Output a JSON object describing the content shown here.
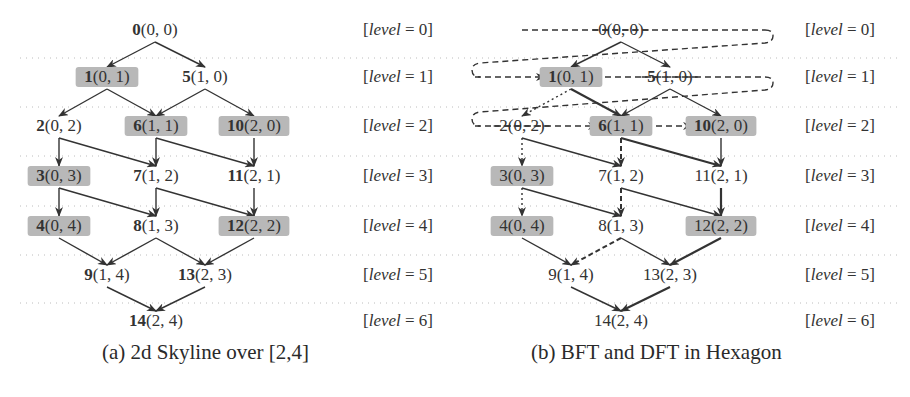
{
  "colors": {
    "ink": "#333333",
    "highlight": "#b8b8b8",
    "gridline": "#bcbcbc",
    "background": "#ffffff"
  },
  "panels": [
    {
      "id": "a",
      "caption": "(a) 2d Skyline over [2,4]",
      "bold_ids": true,
      "level_x": 363,
      "nodes": [
        {
          "id": "0",
          "coord": "(0,0)",
          "level": 0,
          "x": 155,
          "highlighted": false
        },
        {
          "id": "1",
          "coord": "(0,1)",
          "level": 1,
          "x": 107,
          "highlighted": true
        },
        {
          "id": "5",
          "coord": "(1,0)",
          "level": 1,
          "x": 205,
          "highlighted": false
        },
        {
          "id": "2",
          "coord": "(0,2)",
          "level": 2,
          "x": 59,
          "highlighted": false
        },
        {
          "id": "6",
          "coord": "(1,1)",
          "level": 2,
          "x": 156,
          "highlighted": true
        },
        {
          "id": "10",
          "coord": "(2,0)",
          "level": 2,
          "x": 254,
          "highlighted": true
        },
        {
          "id": "3",
          "coord": "(0,3)",
          "level": 3,
          "x": 59,
          "highlighted": true
        },
        {
          "id": "7",
          "coord": "(1,2)",
          "level": 3,
          "x": 156,
          "highlighted": false
        },
        {
          "id": "11",
          "coord": "(2,1)",
          "level": 3,
          "x": 254,
          "highlighted": false
        },
        {
          "id": "4",
          "coord": "(0,4)",
          "level": 4,
          "x": 59,
          "highlighted": true
        },
        {
          "id": "8",
          "coord": "(1,3)",
          "level": 4,
          "x": 156,
          "highlighted": false
        },
        {
          "id": "12",
          "coord": "(2,2)",
          "level": 4,
          "x": 254,
          "highlighted": true
        },
        {
          "id": "9",
          "coord": "(1,4)",
          "level": 5,
          "x": 107,
          "highlighted": false
        },
        {
          "id": "13",
          "coord": "(2,3)",
          "level": 5,
          "x": 205,
          "highlighted": false
        },
        {
          "id": "14",
          "coord": "(2,4)",
          "level": 6,
          "x": 156,
          "highlighted": false
        }
      ],
      "edges": [
        {
          "from": "0",
          "to": "1",
          "style": "solid"
        },
        {
          "from": "0",
          "to": "5",
          "style": "solid"
        },
        {
          "from": "1",
          "to": "2",
          "style": "solid"
        },
        {
          "from": "1",
          "to": "6",
          "style": "solid"
        },
        {
          "from": "5",
          "to": "6",
          "style": "solid"
        },
        {
          "from": "5",
          "to": "10",
          "style": "solid"
        },
        {
          "from": "2",
          "to": "3",
          "style": "solid"
        },
        {
          "from": "2",
          "to": "7",
          "style": "solid"
        },
        {
          "from": "6",
          "to": "7",
          "style": "solid"
        },
        {
          "from": "6",
          "to": "11",
          "style": "solid"
        },
        {
          "from": "10",
          "to": "11",
          "style": "solid"
        },
        {
          "from": "3",
          "to": "4",
          "style": "solid"
        },
        {
          "from": "3",
          "to": "8",
          "style": "solid"
        },
        {
          "from": "7",
          "to": "8",
          "style": "solid"
        },
        {
          "from": "7",
          "to": "12",
          "style": "solid"
        },
        {
          "from": "11",
          "to": "12",
          "style": "solid"
        },
        {
          "from": "4",
          "to": "9",
          "style": "solid"
        },
        {
          "from": "8",
          "to": "9",
          "style": "solid"
        },
        {
          "from": "8",
          "to": "13",
          "style": "solid"
        },
        {
          "from": "12",
          "to": "13",
          "style": "solid"
        },
        {
          "from": "9",
          "to": "14",
          "style": "solid"
        },
        {
          "from": "13",
          "to": "14",
          "style": "solid"
        }
      ]
    },
    {
      "id": "b",
      "caption": "(b) BFT and DFT in Hexagon",
      "bold_ids": false,
      "level_x": 805,
      "nodes": [
        {
          "id": "0",
          "coord": "(0,0)",
          "level": 0,
          "x": 621,
          "highlighted": false,
          "struck": true
        },
        {
          "id": "1",
          "coord": "(0,1)",
          "level": 1,
          "x": 571,
          "highlighted": true,
          "bold": true
        },
        {
          "id": "5",
          "coord": "(1,0)",
          "level": 1,
          "x": 670,
          "highlighted": false,
          "struck": true,
          "bold": true
        },
        {
          "id": "2",
          "coord": "(0,2)",
          "level": 2,
          "x": 522,
          "highlighted": false,
          "struck": true
        },
        {
          "id": "6",
          "coord": "(1,1)",
          "level": 2,
          "x": 621,
          "highlighted": true,
          "bold": true
        },
        {
          "id": "10",
          "coord": "(2,0)",
          "level": 2,
          "x": 721,
          "highlighted": true,
          "bold": true
        },
        {
          "id": "3",
          "coord": "(0,3)",
          "level": 3,
          "x": 522,
          "highlighted": true
        },
        {
          "id": "7",
          "coord": "(1,2)",
          "level": 3,
          "x": 621,
          "highlighted": false
        },
        {
          "id": "11",
          "coord": "(2,1)",
          "level": 3,
          "x": 721,
          "highlighted": false
        },
        {
          "id": "4",
          "coord": "(0,4)",
          "level": 4,
          "x": 522,
          "highlighted": true
        },
        {
          "id": "8",
          "coord": "(1,3)",
          "level": 4,
          "x": 621,
          "highlighted": false
        },
        {
          "id": "12",
          "coord": "(2,2)",
          "level": 4,
          "x": 721,
          "highlighted": true
        },
        {
          "id": "9",
          "coord": "(1,4)",
          "level": 5,
          "x": 571,
          "highlighted": false
        },
        {
          "id": "13",
          "coord": "(2,3)",
          "level": 5,
          "x": 670,
          "highlighted": false
        },
        {
          "id": "14",
          "coord": "(2,4)",
          "level": 6,
          "x": 621,
          "highlighted": false
        }
      ],
      "edges": [
        {
          "from": "0",
          "to": "1",
          "style": "solid"
        },
        {
          "from": "0",
          "to": "5",
          "style": "solid"
        },
        {
          "from": "1",
          "to": "2",
          "style": "dotted"
        },
        {
          "from": "1",
          "to": "6",
          "style": "thick"
        },
        {
          "from": "5",
          "to": "6",
          "style": "solid"
        },
        {
          "from": "5",
          "to": "10",
          "style": "solid"
        },
        {
          "from": "2",
          "to": "3",
          "style": "dotted"
        },
        {
          "from": "2",
          "to": "7",
          "style": "solid"
        },
        {
          "from": "6",
          "to": "7",
          "style": "dashed"
        },
        {
          "from": "6",
          "to": "11",
          "style": "thick"
        },
        {
          "from": "10",
          "to": "11",
          "style": "solid"
        },
        {
          "from": "3",
          "to": "4",
          "style": "dotted"
        },
        {
          "from": "3",
          "to": "8",
          "style": "solid"
        },
        {
          "from": "7",
          "to": "8",
          "style": "dashed"
        },
        {
          "from": "7",
          "to": "12",
          "style": "solid"
        },
        {
          "from": "11",
          "to": "12",
          "style": "thick"
        },
        {
          "from": "4",
          "to": "9",
          "style": "solid"
        },
        {
          "from": "8",
          "to": "9",
          "style": "dashed"
        },
        {
          "from": "8",
          "to": "13",
          "style": "solid"
        },
        {
          "from": "12",
          "to": "13",
          "style": "thick"
        },
        {
          "from": "9",
          "to": "14",
          "style": "solid"
        },
        {
          "from": "13",
          "to": "14",
          "style": "thick"
        }
      ],
      "bft_path": [
        {
          "from_x": 522,
          "to_x": 765,
          "level": 0,
          "wrap_to_level": 1
        },
        {
          "from_x": 475,
          "to_x": 545,
          "level": 1,
          "arrow": true
        },
        {
          "from_x": 595,
          "to_x": 765,
          "level": 1,
          "wrap_to_level": 2
        },
        {
          "from_x": 475,
          "to_x": 597,
          "level": 2,
          "arrow": true
        },
        {
          "from_x": 646,
          "to_x": 692,
          "level": 2,
          "arrow": true
        }
      ]
    }
  ],
  "levels": [
    {
      "label": "[level = 0]",
      "y": 35
    },
    {
      "label": "[level = 1]",
      "y": 82
    },
    {
      "label": "[level = 2]",
      "y": 131
    },
    {
      "label": "[level = 3]",
      "y": 181
    },
    {
      "label": "[level = 4]",
      "y": 231
    },
    {
      "label": "[level = 5]",
      "y": 280
    },
    {
      "label": "[level = 6]",
      "y": 326
    }
  ],
  "gridline_ys": [
    58,
    107,
    156,
    206,
    255,
    303
  ]
}
